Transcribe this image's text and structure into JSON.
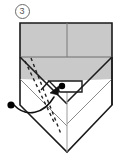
{
  "diagram": {
    "kind": "origami-fold-step",
    "step_label": "3",
    "step_label_style": "circled-number",
    "title": "",
    "caption": "",
    "colors": {
      "paper_shaded": "#c9c9c9",
      "paper_shaded_light": "#d4d4d4",
      "paper_white": "#ffffff",
      "outline": "#1a1a1a",
      "crease_line": "#8d8d8d",
      "dashed_fold_line": "#2b2b2b",
      "reference_dot": "#000000",
      "arrow": "#111111",
      "background": "#ffffff",
      "step_number": "#555555"
    },
    "markers": {
      "source_dot": {
        "label": "reference point (start)",
        "x": 11,
        "y": 105
      },
      "target_dot": {
        "label": "reference point (end)",
        "x": 62,
        "y": 86
      }
    },
    "annotations": [
      {
        "name": "fold-arrow",
        "type": "curved-arrow",
        "meaning": "fold corner up to meet point"
      },
      {
        "name": "valley-fold-line-left",
        "type": "dashed",
        "meaning": "valley fold"
      },
      {
        "name": "valley-fold-line-right",
        "type": "dashed",
        "meaning": "valley fold"
      }
    ],
    "geometry": {
      "top_band_top": 22,
      "top_band_bottom": 57,
      "body_left": 19,
      "body_right": 112,
      "center_x": 67,
      "bottom_apex_y": 152
    }
  }
}
